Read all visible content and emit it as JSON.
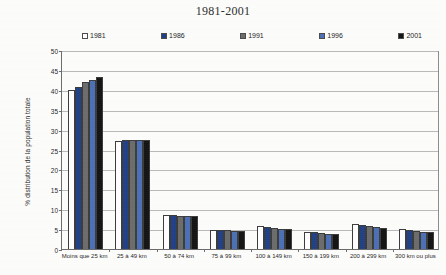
{
  "chart_data": {
    "type": "bar",
    "title": "1981-2001",
    "xlabel": "",
    "ylabel": "% distribution de la population totale",
    "ylim": [
      0,
      50
    ],
    "ytick_step": 5,
    "grid": true,
    "legend_position": "top",
    "categories": [
      "Moins que 25 km",
      "25 à 49 km",
      "50 à 74 km",
      "75 à 99 km",
      "100 à 149 km",
      "150 à 199 km",
      "200 à 299 km",
      "300 km ou plus"
    ],
    "yticks": [
      "0",
      "5",
      "10",
      "15",
      "20",
      "25",
      "30",
      "35",
      "40",
      "45",
      "50"
    ],
    "series": [
      {
        "name": "1981",
        "color": "#ffffff",
        "values": [
          39.9,
          27.1,
          8.6,
          4.9,
          5.7,
          4.4,
          6.2,
          5.0
        ]
      },
      {
        "name": "1986",
        "color": "#1f3f85",
        "values": [
          40.8,
          27.3,
          8.5,
          4.8,
          5.5,
          4.3,
          6.1,
          4.8
        ]
      },
      {
        "name": "1991",
        "color": "#6b6b6b",
        "values": [
          41.9,
          27.4,
          8.4,
          4.7,
          5.2,
          4.0,
          5.8,
          4.5
        ]
      },
      {
        "name": "1996",
        "color": "#4a6fb5",
        "values": [
          42.5,
          27.4,
          8.4,
          4.6,
          5.0,
          3.8,
          5.5,
          4.4
        ]
      },
      {
        "name": "2001",
        "color": "#121212",
        "values": [
          43.3,
          27.4,
          8.2,
          4.5,
          5.0,
          3.7,
          5.4,
          4.3
        ]
      }
    ]
  },
  "colors": {
    "axis": "#6b6b6b",
    "gridline": "#b9b9b9",
    "background": "#fdfdfc",
    "text": "#1d1d1d"
  }
}
